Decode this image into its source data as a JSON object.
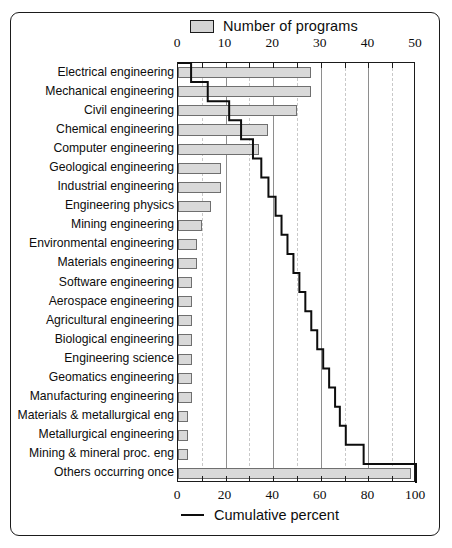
{
  "figure": {
    "legend_top": {
      "label": "Number of programs",
      "swatch_name": "bar-swatch",
      "swatch_color": "#d9d9d9"
    },
    "legend_bottom": {
      "label": "Cumulative percent",
      "line_color": "#0d0d0d"
    }
  },
  "chart_data": {
    "type": "bar",
    "title": "",
    "orientation": "horizontal",
    "xlabel": "",
    "ylabel": "",
    "grid": true,
    "legend_position": "top and bottom",
    "top_axis": {
      "name": "Number of programs",
      "ticks": [
        0,
        10,
        20,
        30,
        40,
        50
      ],
      "minor_ticks": [
        5,
        15,
        25,
        35,
        45
      ],
      "range": [
        0,
        50
      ]
    },
    "bottom_axis": {
      "name": "Cumulative percent",
      "ticks": [
        0,
        20,
        40,
        60,
        80,
        100
      ],
      "minor_ticks": [
        10,
        30,
        50,
        70,
        90
      ],
      "range": [
        0,
        100
      ]
    },
    "categories": [
      "Electrical engineering",
      "Mechanical engineering",
      "Civil engineering",
      "Chemical engineering",
      "Computer engineering",
      "Geological engineering",
      "Industrial engineering",
      "Engineering physics",
      "Mining engineering",
      "Environmental engineering",
      "Materials engineering",
      "Software engineering",
      "Aerospace engineering",
      "Agricultural engineering",
      "Biological engineering",
      "Engineering science",
      "Geomatics engineering",
      "Manufacturing engineering",
      "Materials & metallurgical eng",
      "Metallurgical engineering",
      "Mining & mineral proc. eng",
      "Others occurring once"
    ],
    "values": [
      28,
      28,
      25,
      19,
      17,
      9,
      9,
      7,
      5,
      4,
      4,
      3,
      3,
      3,
      3,
      3,
      3,
      3,
      2,
      2,
      2,
      49
    ],
    "cumulative_percent": [
      5.5,
      12.5,
      21.5,
      26.5,
      31.5,
      35.0,
      38.0,
      41.0,
      43.5,
      46.0,
      48.5,
      51.0,
      53.5,
      56.0,
      58.5,
      61.0,
      63.5,
      66.0,
      68.0,
      70.5,
      78.0,
      100.0
    ]
  }
}
